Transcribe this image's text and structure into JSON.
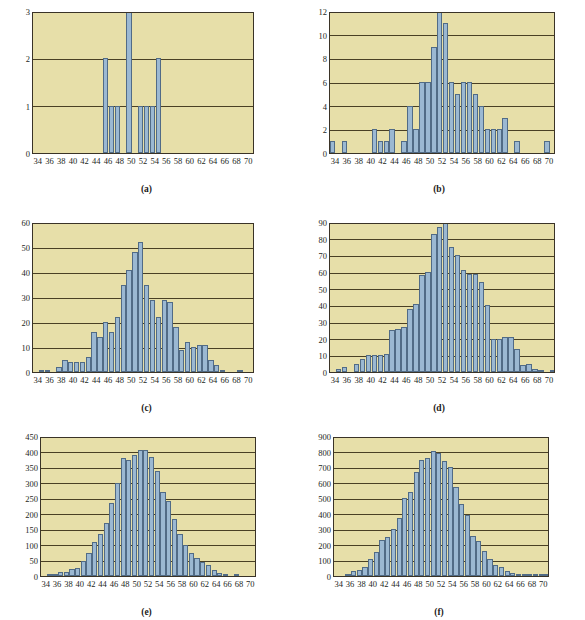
{
  "figure": {
    "type": "multi-panel-histogram-figure",
    "panel_count": 6,
    "colors": {
      "plot_background": "#e7dfa9",
      "bar_fill": "#9bb8d2",
      "bar_stroke": "#516b86",
      "axis": "#3a3327",
      "gridline": "#4a4024",
      "text": "#231f1c",
      "page_background": "#ffffff"
    },
    "shared_x": {
      "label": "",
      "ticks": [
        34,
        36,
        38,
        40,
        42,
        44,
        46,
        48,
        50,
        52,
        54,
        56,
        58,
        60,
        62,
        64,
        66,
        68,
        70
      ],
      "min": 33,
      "max": 71,
      "bin_width": 1
    }
  },
  "chart_data": [
    {
      "id": "a",
      "caption": "(a)",
      "type": "bar",
      "title": "",
      "xlabel": "",
      "ylabel": "",
      "xlim": [
        33,
        71
      ],
      "ylim": [
        0,
        3
      ],
      "yticks": [
        0,
        1,
        2,
        3
      ],
      "xticks": [
        34,
        36,
        38,
        40,
        42,
        44,
        46,
        48,
        50,
        52,
        54,
        56,
        58,
        60,
        62,
        64,
        66,
        68,
        70
      ],
      "grid": true,
      "bin_width": 1,
      "bins": [
        33,
        34,
        35,
        36,
        37,
        38,
        39,
        40,
        41,
        42,
        43,
        44,
        45,
        46,
        47,
        48,
        49,
        50,
        51,
        52,
        53,
        54,
        55,
        56,
        57,
        58,
        59,
        60,
        61,
        62,
        63,
        64,
        65,
        66,
        67,
        68,
        69,
        70
      ],
      "values": [
        0,
        0,
        0,
        0,
        0,
        0,
        0,
        0,
        0,
        0,
        0,
        0,
        2,
        1,
        1,
        0,
        3,
        0,
        1,
        1,
        1,
        2,
        0,
        0,
        0,
        0,
        0,
        0,
        0,
        0,
        0,
        0,
        0,
        0,
        0,
        0,
        0,
        0
      ]
    },
    {
      "id": "b",
      "caption": "(b)",
      "type": "bar",
      "title": "",
      "xlabel": "",
      "ylabel": "",
      "xlim": [
        33,
        71
      ],
      "ylim": [
        0,
        12
      ],
      "yticks": [
        0,
        2,
        4,
        6,
        8,
        10,
        12
      ],
      "xticks": [
        34,
        36,
        38,
        40,
        42,
        44,
        46,
        48,
        50,
        52,
        54,
        56,
        58,
        60,
        62,
        64,
        66,
        68,
        70
      ],
      "grid": true,
      "bin_width": 1,
      "bins": [
        33,
        34,
        35,
        36,
        37,
        38,
        39,
        40,
        41,
        42,
        43,
        44,
        45,
        46,
        47,
        48,
        49,
        50,
        51,
        52,
        53,
        54,
        55,
        56,
        57,
        58,
        59,
        60,
        61,
        62,
        63,
        64,
        65,
        66,
        67,
        68,
        69,
        70
      ],
      "values": [
        1,
        0,
        1,
        0,
        0,
        0,
        0,
        2,
        1,
        1,
        2,
        0,
        1,
        4,
        2,
        6,
        6,
        9,
        12,
        11,
        6,
        5,
        6,
        6,
        5,
        4,
        2,
        2,
        2,
        3,
        0,
        1,
        0,
        0,
        0,
        0,
        1,
        0
      ]
    },
    {
      "id": "c",
      "caption": "(c)",
      "type": "bar",
      "title": "",
      "xlabel": "",
      "ylabel": "",
      "xlim": [
        33,
        71
      ],
      "ylim": [
        0,
        60
      ],
      "yticks": [
        0,
        10,
        20,
        30,
        40,
        50,
        60
      ],
      "xticks": [
        34,
        36,
        38,
        40,
        42,
        44,
        46,
        48,
        50,
        52,
        54,
        56,
        58,
        60,
        62,
        64,
        66,
        68,
        70
      ],
      "grid": true,
      "bin_width": 1,
      "bins": [
        33,
        34,
        35,
        36,
        37,
        38,
        39,
        40,
        41,
        42,
        43,
        44,
        45,
        46,
        47,
        48,
        49,
        50,
        51,
        52,
        53,
        54,
        55,
        56,
        57,
        58,
        59,
        60,
        61,
        62,
        63,
        64,
        65,
        66,
        67,
        68,
        69,
        70
      ],
      "values": [
        0,
        1,
        1,
        0,
        2,
        5,
        4,
        4,
        4,
        6,
        16,
        14,
        20,
        16,
        22,
        35,
        41,
        48,
        52,
        35,
        29,
        22,
        29,
        28,
        18,
        9,
        12,
        10,
        11,
        11,
        5,
        3,
        1,
        0,
        0,
        1,
        0,
        0
      ]
    },
    {
      "id": "d",
      "caption": "(d)",
      "type": "bar",
      "title": "",
      "xlabel": "",
      "ylabel": "",
      "xlim": [
        33,
        71
      ],
      "ylim": [
        0,
        90
      ],
      "yticks": [
        0,
        10,
        20,
        30,
        40,
        50,
        60,
        70,
        80,
        90
      ],
      "xticks": [
        34,
        36,
        38,
        40,
        42,
        44,
        46,
        48,
        50,
        52,
        54,
        56,
        58,
        60,
        62,
        64,
        66,
        68,
        70
      ],
      "grid": true,
      "bin_width": 1,
      "bins": [
        33,
        34,
        35,
        36,
        37,
        38,
        39,
        40,
        41,
        42,
        43,
        44,
        45,
        46,
        47,
        48,
        49,
        50,
        51,
        52,
        53,
        54,
        55,
        56,
        57,
        58,
        59,
        60,
        61,
        62,
        63,
        64,
        65,
        66,
        67,
        68,
        69,
        70
      ],
      "values": [
        0,
        2,
        3,
        0,
        5,
        8,
        10,
        10,
        10,
        11,
        25,
        26,
        27,
        38,
        41,
        58,
        60,
        83,
        87,
        90,
        75,
        70,
        61,
        59,
        59,
        54,
        40,
        20,
        20,
        21,
        21,
        14,
        4,
        5,
        2,
        1,
        0,
        1
      ]
    },
    {
      "id": "e",
      "caption": "(e)",
      "type": "bar",
      "title": "",
      "xlabel": "",
      "ylabel": "",
      "xlim": [
        33,
        71
      ],
      "ylim": [
        0,
        450
      ],
      "yticks": [
        0,
        50,
        100,
        150,
        200,
        250,
        300,
        350,
        400,
        450
      ],
      "xticks": [
        34,
        36,
        38,
        40,
        42,
        44,
        46,
        48,
        50,
        52,
        54,
        56,
        58,
        60,
        62,
        64,
        66,
        68,
        70
      ],
      "grid": true,
      "bin_width": 1,
      "bins": [
        33,
        34,
        35,
        36,
        37,
        38,
        39,
        40,
        41,
        42,
        43,
        44,
        45,
        46,
        47,
        48,
        49,
        50,
        51,
        52,
        53,
        54,
        55,
        56,
        57,
        58,
        59,
        60,
        61,
        62,
        63,
        64,
        65,
        66,
        67,
        68,
        69,
        70
      ],
      "values": [
        0,
        3,
        5,
        13,
        14,
        21,
        25,
        47,
        74,
        110,
        134,
        172,
        234,
        300,
        378,
        374,
        390,
        404,
        404,
        382,
        338,
        271,
        240,
        182,
        135,
        101,
        75,
        57,
        45,
        34,
        20,
        11,
        3,
        0,
        5,
        0,
        0,
        0
      ]
    },
    {
      "id": "f",
      "caption": "(f)",
      "type": "bar",
      "title": "",
      "xlabel": "",
      "ylabel": "",
      "xlim": [
        33,
        71
      ],
      "ylim": [
        0,
        900
      ],
      "yticks": [
        0,
        100,
        200,
        300,
        400,
        500,
        600,
        700,
        800,
        900
      ],
      "xticks": [
        34,
        36,
        38,
        40,
        42,
        44,
        46,
        48,
        50,
        52,
        54,
        56,
        58,
        60,
        62,
        64,
        66,
        68,
        70
      ],
      "grid": true,
      "bin_width": 1,
      "bins": [
        33,
        34,
        35,
        36,
        37,
        38,
        39,
        40,
        41,
        42,
        43,
        44,
        45,
        46,
        47,
        48,
        49,
        50,
        51,
        52,
        53,
        54,
        55,
        56,
        57,
        58,
        59,
        60,
        61,
        62,
        63,
        64,
        65,
        66,
        67,
        68,
        69,
        70
      ],
      "values": [
        0,
        0,
        12,
        32,
        38,
        60,
        108,
        152,
        230,
        250,
        300,
        370,
        500,
        540,
        668,
        745,
        760,
        805,
        790,
        740,
        700,
        570,
        465,
        390,
        258,
        222,
        160,
        108,
        72,
        58,
        32,
        18,
        8,
        5,
        5,
        15,
        8,
        3
      ]
    }
  ]
}
